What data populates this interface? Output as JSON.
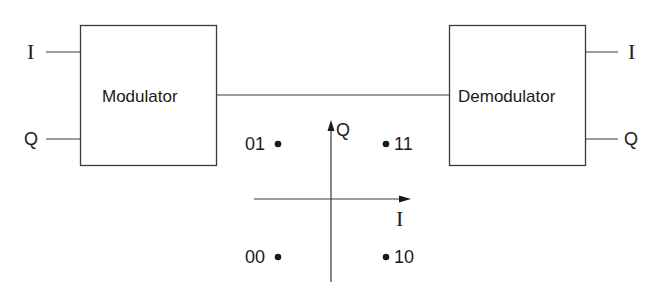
{
  "diagram": {
    "type": "block-diagram-with-constellation",
    "blocks": [
      {
        "id": "modulator",
        "label": "Modulator"
      },
      {
        "id": "demodulator",
        "label": "Demodulator"
      }
    ],
    "modulator_inputs": {
      "i": "I",
      "q": "Q"
    },
    "demodulator_outputs": {
      "i": "I",
      "q": "Q"
    },
    "connection": {
      "from": "modulator",
      "to": "demodulator"
    },
    "constellation": {
      "axes": {
        "horizontal": "I",
        "vertical": "Q"
      },
      "points": [
        {
          "label": "01",
          "quadrant": "upper-left"
        },
        {
          "label": "11",
          "quadrant": "upper-right"
        },
        {
          "label": "00",
          "quadrant": "lower-left"
        },
        {
          "label": "10",
          "quadrant": "lower-right"
        }
      ]
    },
    "colors": {
      "line": "#3a3a3a",
      "text": "#1a1a1a",
      "background": "#ffffff"
    }
  }
}
